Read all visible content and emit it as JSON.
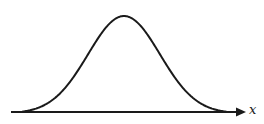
{
  "diagram": {
    "type": "bell-curve",
    "curve": {
      "shape": "gaussian",
      "peak": {
        "x": 124,
        "y": 16
      },
      "left_end": {
        "x": 23,
        "y": 105
      },
      "right_end": {
        "x": 227,
        "y": 104
      },
      "stroke_color": "#1a1a1a",
      "stroke_width": 2
    },
    "axis": {
      "label": "x",
      "start": {
        "x": 11,
        "y": 112
      },
      "end": {
        "x": 246,
        "y": 112
      },
      "arrow": "right",
      "stroke_color": "#1a1a1a",
      "stroke_width": 2
    }
  }
}
